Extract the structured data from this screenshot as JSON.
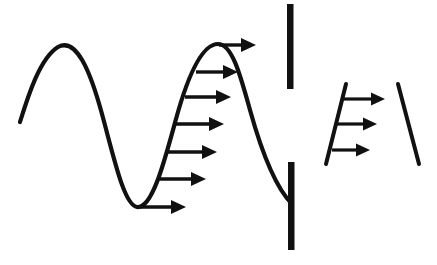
{
  "figure": {
    "background_color": "#ffffff",
    "ink_color": "#111111",
    "width": 437,
    "height": 265
  },
  "wave_curve": {
    "name": "sinusoidal-wave-curve",
    "stroke_width": 4.2,
    "description": "Continuous sinusoidal curve: rises to a crest at left, falls to a trough, rises to a second crest, then falls to meet the lower vertical bar",
    "path": "M 20 122 C 28 96 40 58 58 47 C 76 37 90 70 102 114 C 114 158 124 205 137 207 C 152 209 164 163 176 119 C 190 68 204 44 218 44 C 232 44 240 74 250 110 C 260 146 274 186 292 204",
    "key_points": [
      {
        "label": "left-tail-start",
        "x": 20,
        "y": 122
      },
      {
        "label": "first-crest",
        "x": 58,
        "y": 47
      },
      {
        "label": "trough",
        "x": 137,
        "y": 207
      },
      {
        "label": "second-crest",
        "x": 218,
        "y": 44
      },
      {
        "label": "right-tail-end",
        "x": 292,
        "y": 204
      }
    ]
  },
  "left_arrows": {
    "name": "velocity-profile-arrows-left",
    "count": 7,
    "shaft_width": 3.4,
    "head_length": 15,
    "head_half_width": 7,
    "items": [
      {
        "index": 0,
        "label": "arrow-crest-top",
        "x1": 219,
        "y1": 45,
        "x2": 256,
        "y2": 45
      },
      {
        "index": 1,
        "label": "arrow-level-2",
        "x1": 196,
        "y1": 72,
        "x2": 238,
        "y2": 72
      },
      {
        "index": 2,
        "label": "arrow-level-3",
        "x1": 185,
        "y1": 97,
        "x2": 231,
        "y2": 97
      },
      {
        "index": 3,
        "label": "arrow-level-4",
        "x1": 176,
        "y1": 124,
        "x2": 224,
        "y2": 124
      },
      {
        "index": 4,
        "label": "arrow-level-5",
        "x1": 168,
        "y1": 152,
        "x2": 217,
        "y2": 152
      },
      {
        "index": 5,
        "label": "arrow-level-6",
        "x1": 159,
        "y1": 179,
        "x2": 206,
        "y2": 179
      },
      {
        "index": 6,
        "label": "arrow-trough-base",
        "x1": 139,
        "y1": 207,
        "x2": 186,
        "y2": 207
      }
    ]
  },
  "vertical_bars": {
    "name": "interface-boundary-bars",
    "count": 2,
    "items": [
      {
        "index": 0,
        "label": "upper-boundary-bar",
        "x": 287,
        "y": 4,
        "width": 6.5,
        "height": 85
      },
      {
        "index": 1,
        "label": "lower-boundary-bar",
        "x": 288,
        "y": 162,
        "width": 6.5,
        "height": 88
      }
    ]
  },
  "right_figure": {
    "name": "downstream-velocity-profile",
    "left_line": {
      "label": "left-slanted-boundary",
      "x1": 346,
      "y1": 84,
      "x2": 326,
      "y2": 164,
      "stroke_width": 4.0
    },
    "right_line": {
      "label": "right-slanted-boundary",
      "x1": 398,
      "y1": 84,
      "x2": 419,
      "y2": 164,
      "stroke_width": 4.0
    },
    "arrows": {
      "count": 3,
      "shaft_width": 3.2,
      "head_length": 14,
      "head_half_width": 6.5,
      "items": [
        {
          "index": 0,
          "label": "right-arrow-top",
          "x1": 342,
          "y1": 99,
          "x2": 385,
          "y2": 99
        },
        {
          "index": 1,
          "label": "right-arrow-middle",
          "x1": 337,
          "y1": 124,
          "x2": 377,
          "y2": 124
        },
        {
          "index": 2,
          "label": "right-arrow-bottom",
          "x1": 332,
          "y1": 150,
          "x2": 370,
          "y2": 150
        }
      ]
    }
  }
}
